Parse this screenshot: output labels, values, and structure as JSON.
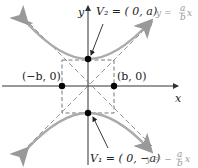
{
  "diagram": {
    "type": "hyperbola-vertical",
    "axes": {
      "x_label": "x",
      "y_label": "y"
    },
    "points": [
      {
        "id": "V2",
        "label": "V₂ = ( 0, a)"
      },
      {
        "id": "V1",
        "label": "V₁ = ( 0, −a)"
      },
      {
        "id": "left",
        "label": "(−b, 0)"
      },
      {
        "id": "right",
        "label": "(b, 0)"
      }
    ],
    "asymptotes": [
      {
        "label_prefix": "y = ",
        "num": "a",
        "den": "b",
        "suffix": "x"
      },
      {
        "label_prefix": "y = −",
        "num": "a",
        "den": "b",
        "suffix": "x"
      }
    ],
    "colors": {
      "curve": "#aaaaaa",
      "axes": "#333333",
      "dashed": "#777777",
      "points": "#000000",
      "asymptote_label": "#999999"
    }
  }
}
